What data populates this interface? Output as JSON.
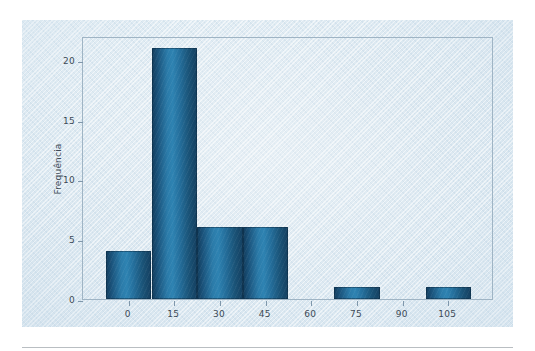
{
  "figure": {
    "background_color": "#dde8f0",
    "plot_border_color": "#9fb4c4",
    "bar_color": "#1f5f86"
  },
  "chart_data": {
    "type": "bar",
    "title": "",
    "subtitle": "",
    "xlabel": "",
    "ylabel": "Frequência",
    "grid": false,
    "legend": "none",
    "bin_width": 15,
    "xlim": [
      -15,
      120
    ],
    "ylim": [
      0,
      22
    ],
    "xticks": [
      0,
      15,
      30,
      45,
      60,
      75,
      90,
      105
    ],
    "xticklabels": [
      "0",
      "15",
      "30",
      "45",
      "60",
      "75",
      "90",
      "105"
    ],
    "yticks": [
      0,
      5,
      10,
      15,
      20
    ],
    "yticklabels": [
      "0",
      "5",
      "10",
      "15",
      "20"
    ],
    "bins": [
      {
        "left": -7.5,
        "right": 7.5,
        "value": 4
      },
      {
        "left": 7.5,
        "right": 22.5,
        "value": 21
      },
      {
        "left": 22.5,
        "right": 37.5,
        "value": 6
      },
      {
        "left": 37.5,
        "right": 52.5,
        "value": 6
      },
      {
        "left": 52.5,
        "right": 67.5,
        "value": 0
      },
      {
        "left": 67.5,
        "right": 82.5,
        "value": 1
      },
      {
        "left": 82.5,
        "right": 97.5,
        "value": 0
      },
      {
        "left": 97.5,
        "right": 112.5,
        "value": 1
      }
    ],
    "categories": [
      "-7.5–7.5",
      "7.5–22.5",
      "22.5–37.5",
      "37.5–52.5",
      "52.5–67.5",
      "67.5–82.5",
      "82.5–97.5",
      "97.5–112.5"
    ],
    "values": [
      4,
      21,
      6,
      6,
      0,
      1,
      0,
      1
    ]
  }
}
